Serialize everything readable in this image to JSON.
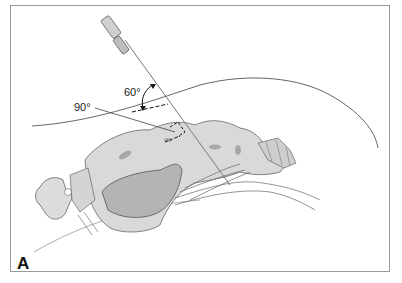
{
  "figure": {
    "panel_label": "A",
    "angle_labels": {
      "needle_to_skin": "60°",
      "needle_to_bone": "90°"
    },
    "colors": {
      "frame": "#9a9a9a",
      "bone_fill": "#d9d9d9",
      "bone_dark": "#a8a8a8",
      "outline": "#555555",
      "needle": "#777777"
    }
  }
}
